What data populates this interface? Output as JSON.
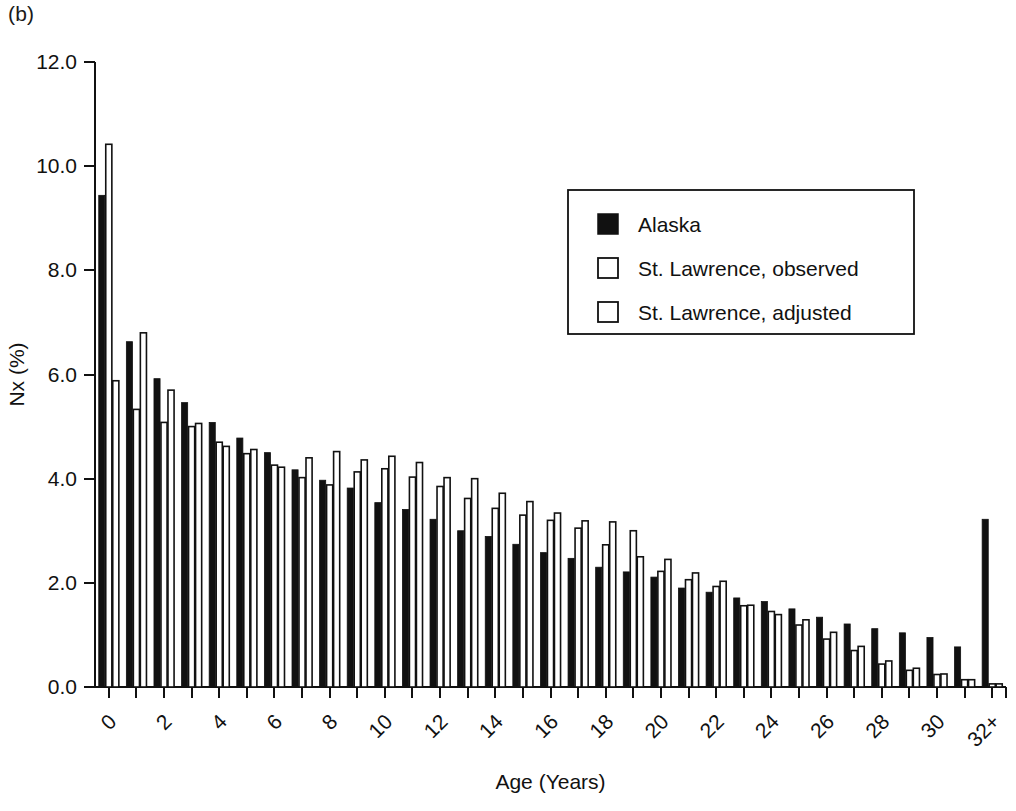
{
  "panel": {
    "label": "(b)"
  },
  "chart_data": {
    "type": "bar",
    "title": "",
    "xlabel": "Age (Years)",
    "ylabel": "Nx (%)",
    "ylim": [
      0.0,
      12.0
    ],
    "yticks": [
      "0.0",
      "2.0",
      "4.0",
      "6.0",
      "8.0",
      "10.0",
      "12.0"
    ],
    "ytick_values": [
      0.0,
      2.0,
      4.0,
      6.0,
      8.0,
      10.0,
      12.0
    ],
    "grid": false,
    "legend_position": "upper right",
    "xtick_labels": [
      "0",
      "2",
      "4",
      "6",
      "8",
      "10",
      "12",
      "14",
      "16",
      "18",
      "20",
      "22",
      "24",
      "26",
      "28",
      "30",
      "32+"
    ],
    "categories": [
      "0",
      "1",
      "2",
      "3",
      "4",
      "5",
      "6",
      "7",
      "8",
      "9",
      "10",
      "11",
      "12",
      "13",
      "14",
      "15",
      "16",
      "17",
      "18",
      "19",
      "20",
      "21",
      "22",
      "23",
      "24",
      "25",
      "26",
      "27",
      "28",
      "29",
      "30",
      "31",
      "32+"
    ],
    "series": [
      {
        "name": "Alaska",
        "style": "filled-black",
        "color": "#111111",
        "values": [
          9.44,
          6.63,
          5.92,
          5.46,
          5.08,
          4.78,
          4.5,
          4.17,
          3.97,
          3.82,
          3.54,
          3.41,
          3.22,
          3.0,
          2.89,
          2.74,
          2.58,
          2.47,
          2.3,
          2.21,
          2.11,
          1.9,
          1.82,
          1.71,
          1.64,
          1.5,
          1.34,
          1.21,
          1.12,
          1.04,
          0.95,
          0.77,
          3.22
        ]
      },
      {
        "name": "St. Lawrence, observed",
        "style": "open-white",
        "color": "#ffffff",
        "values": [
          10.42,
          5.33,
          5.08,
          5.0,
          4.7,
          4.48,
          4.26,
          4.02,
          3.88,
          4.13,
          4.19,
          4.03,
          3.85,
          3.62,
          3.43,
          3.3,
          3.2,
          3.05,
          2.73,
          3.0,
          2.22,
          2.06,
          1.93,
          1.56,
          1.45,
          1.19,
          0.92,
          0.7,
          0.44,
          0.32,
          0.24,
          0.14,
          0.06
        ]
      },
      {
        "name": "St. Lawrence, adjusted",
        "style": "open-white",
        "color": "#ffffff",
        "values": [
          5.88,
          6.8,
          5.7,
          5.06,
          4.62,
          4.56,
          4.22,
          4.4,
          4.52,
          4.36,
          4.43,
          4.31,
          4.02,
          4.0,
          3.72,
          3.56,
          3.34,
          3.19,
          3.17,
          2.5,
          2.45,
          2.19,
          2.03,
          1.57,
          1.39,
          1.29,
          1.05,
          0.78,
          0.5,
          0.36,
          0.25,
          0.14,
          0.06
        ]
      }
    ],
    "legend": [
      {
        "label": "Alaska",
        "swatch": "filled-black"
      },
      {
        "label": "St. Lawrence, observed",
        "swatch": "open-white"
      },
      {
        "label": "St. Lawrence, adjusted",
        "swatch": "open-white"
      }
    ]
  }
}
